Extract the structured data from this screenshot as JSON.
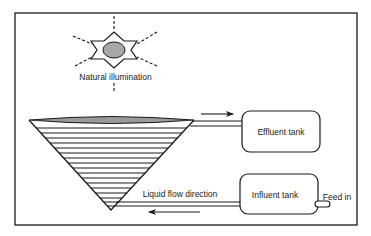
{
  "diagram": {
    "labels": {
      "illumination": "Natural illumination",
      "effluent_tank": "Effluent tank",
      "influent_tank": "Influent tank",
      "flow_direction": "Liquid flow direction",
      "feed_in": "Feed in"
    },
    "colors": {
      "stroke": "#1a1a1a",
      "sun_fill": "#a8a8a8",
      "cone_top_fill": "#9a9a9a",
      "background": "#ffffff"
    },
    "cone": {
      "stripe_count": 17
    }
  }
}
